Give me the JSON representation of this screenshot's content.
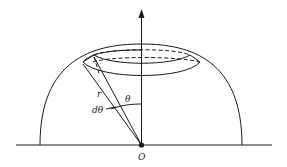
{
  "figure": {
    "labels": {
      "origin": "O",
      "radius": "r",
      "angle": "θ",
      "angle_increment": "dθ"
    },
    "colors": {
      "ink": "#1a1a1a",
      "background": "#ffffff"
    }
  }
}
